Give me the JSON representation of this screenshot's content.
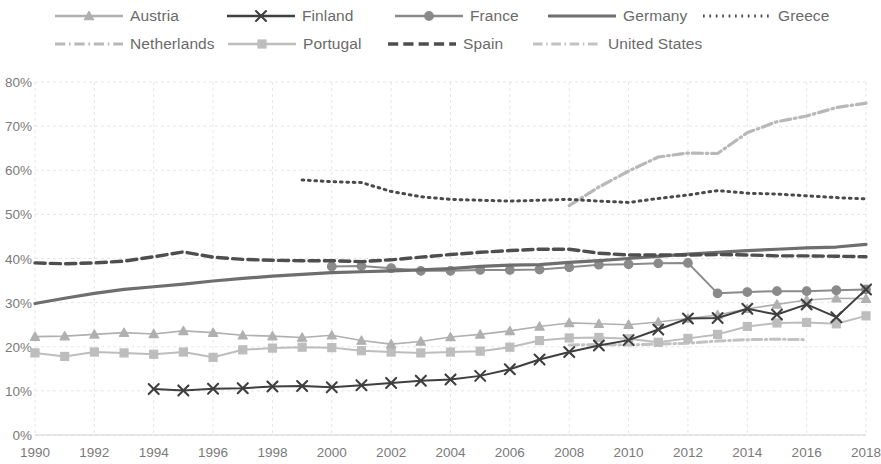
{
  "chart_data": {
    "type": "line",
    "title": "",
    "xlabel": "",
    "ylabel": "",
    "xlim": [
      1990,
      2018
    ],
    "ylim": [
      0,
      80
    ],
    "ytick_labels": [
      "0%",
      "10%",
      "20%",
      "30%",
      "40%",
      "50%",
      "60%",
      "70%",
      "80%"
    ],
    "ytick_values": [
      0,
      10,
      20,
      30,
      40,
      50,
      60,
      70,
      80
    ],
    "xtick_labels": [
      "1990",
      "1992",
      "1994",
      "1996",
      "1998",
      "2000",
      "2002",
      "2004",
      "2006",
      "2008",
      "2010",
      "2012",
      "2014",
      "2016",
      "2018"
    ],
    "xtick_values": [
      1990,
      1992,
      1994,
      1996,
      1998,
      2000,
      2002,
      2004,
      2006,
      2008,
      2010,
      2012,
      2014,
      2016,
      2018
    ],
    "grid": true,
    "legend_position": "top",
    "value_unit": "percent",
    "series": [
      {
        "name": "Austria",
        "color": "#b0b0b0",
        "marker": "triangle",
        "dash": "solid",
        "width": 1.6,
        "x": [
          1990,
          1991,
          1992,
          1993,
          1994,
          1995,
          1996,
          1997,
          1998,
          1999,
          2000,
          2001,
          2002,
          2003,
          2004,
          2005,
          2006,
          2007,
          2008,
          2009,
          2010,
          2011,
          2012,
          2013,
          2014,
          2015,
          2016,
          2017,
          2018
        ],
        "values": [
          22.3,
          22.4,
          22.8,
          23.2,
          22.9,
          23.6,
          23.2,
          22.6,
          22.4,
          22.1,
          22.6,
          21.4,
          20.6,
          21.2,
          22.2,
          22.8,
          23.6,
          24.6,
          25.4,
          25.2,
          25.0,
          25.6,
          26.4,
          27.2,
          28.6,
          29.6,
          30.6,
          31.0,
          30.9
        ]
      },
      {
        "name": "Finland",
        "color": "#3f3f3f",
        "marker": "x",
        "dash": "solid",
        "width": 2.0,
        "x": [
          1994,
          1995,
          1996,
          1997,
          1998,
          1999,
          2000,
          2001,
          2002,
          2003,
          2004,
          2005,
          2006,
          2007,
          2008,
          2009,
          2010,
          2011,
          2012,
          2013,
          2014,
          2015,
          2016,
          2017,
          2018
        ],
        "values": [
          10.4,
          10.1,
          10.5,
          10.6,
          11.0,
          11.1,
          10.8,
          11.3,
          11.8,
          12.3,
          12.6,
          13.4,
          14.9,
          17.1,
          18.8,
          20.3,
          21.5,
          23.9,
          26.4,
          26.5,
          28.6,
          27.3,
          29.6,
          26.7,
          33.0
        ]
      },
      {
        "name": "France",
        "color": "#8a8a8a",
        "marker": "circle",
        "dash": "solid",
        "width": 2.0,
        "x": [
          2000,
          2001,
          2002,
          2003,
          2004,
          2005,
          2006,
          2007,
          2008,
          2009,
          2010,
          2011,
          2012,
          2013,
          2014,
          2015,
          2016,
          2017,
          2018
        ],
        "values": [
          38.2,
          38.3,
          37.8,
          37.2,
          37.2,
          37.4,
          37.4,
          37.5,
          38.0,
          38.6,
          38.7,
          38.9,
          39.0,
          32.1,
          32.4,
          32.6,
          32.6,
          32.8,
          33.0
        ]
      },
      {
        "name": "Germany",
        "color": "#6e6e6e",
        "marker": "none",
        "dash": "solid",
        "width": 3.2,
        "x": [
          1990,
          1991,
          1992,
          1993,
          1994,
          1995,
          1996,
          1997,
          1998,
          1999,
          2000,
          2001,
          2002,
          2003,
          2004,
          2005,
          2006,
          2007,
          2008,
          2009,
          2010,
          2011,
          2012,
          2013,
          2014,
          2015,
          2016,
          2017,
          2018
        ],
        "values": [
          29.8,
          31.0,
          32.1,
          33.0,
          33.6,
          34.2,
          34.9,
          35.5,
          36.0,
          36.4,
          36.8,
          37.0,
          37.2,
          37.4,
          37.7,
          38.2,
          38.5,
          38.6,
          39.1,
          39.5,
          40.0,
          40.5,
          41.0,
          41.4,
          41.8,
          42.1,
          42.4,
          42.6,
          43.2
        ]
      },
      {
        "name": "Greece",
        "color": "#4a4a4a",
        "marker": "none",
        "dash": "dotted",
        "width": 3.0,
        "x": [
          1999,
          2000,
          2001,
          2002,
          2003,
          2004,
          2005,
          2006,
          2007,
          2008,
          2009,
          2010,
          2011,
          2012,
          2013,
          2014,
          2015,
          2016,
          2017,
          2018
        ],
        "values": [
          57.8,
          57.4,
          57.2,
          55.2,
          54.0,
          53.4,
          53.2,
          53.0,
          53.2,
          53.4,
          53.0,
          52.7,
          53.6,
          54.4,
          55.4,
          54.8,
          54.6,
          54.2,
          53.8,
          53.5
        ]
      },
      {
        "name": "Netherlands",
        "color": "#b8b8b8",
        "marker": "none",
        "dash": "dashdot",
        "width": 3.2,
        "x": [
          2008,
          2009,
          2010,
          2011,
          2012,
          2013,
          2014,
          2015,
          2016,
          2017,
          2018
        ],
        "values": [
          52.0,
          56.2,
          59.8,
          63.0,
          63.9,
          63.8,
          68.5,
          71.0,
          72.3,
          74.2,
          75.2
        ]
      },
      {
        "name": "Portugal",
        "color": "#bdbdbd",
        "marker": "square",
        "dash": "solid",
        "width": 2.0,
        "x": [
          1990,
          1991,
          1992,
          1993,
          1994,
          1995,
          1996,
          1997,
          1998,
          1999,
          2000,
          2001,
          2002,
          2003,
          2004,
          2005,
          2006,
          2007,
          2008,
          2009,
          2010,
          2011,
          2012,
          2013,
          2014,
          2015,
          2016,
          2017,
          2018
        ],
        "values": [
          18.6,
          17.8,
          18.8,
          18.6,
          18.3,
          18.8,
          17.6,
          19.3,
          19.7,
          19.9,
          19.8,
          19.1,
          18.8,
          18.6,
          18.8,
          19.0,
          19.9,
          21.4,
          22.0,
          22.1,
          21.8,
          21.0,
          21.9,
          22.8,
          24.6,
          25.4,
          25.5,
          25.2,
          27.0
        ]
      },
      {
        "name": "Spain",
        "color": "#4e4e4e",
        "marker": "none",
        "dash": "dashed",
        "width": 3.4,
        "x": [
          1990,
          1991,
          1992,
          1993,
          1994,
          1995,
          1996,
          1997,
          1998,
          1999,
          2000,
          2001,
          2002,
          2003,
          2004,
          2005,
          2006,
          2007,
          2008,
          2009,
          2010,
          2011,
          2012,
          2013,
          2014,
          2015,
          2016,
          2017,
          2018
        ],
        "values": [
          39.0,
          38.8,
          39.0,
          39.4,
          40.4,
          41.5,
          40.3,
          39.8,
          39.6,
          39.5,
          39.5,
          39.3,
          39.7,
          40.3,
          40.9,
          41.4,
          41.8,
          42.1,
          42.1,
          41.2,
          40.8,
          40.8,
          40.8,
          40.9,
          40.8,
          40.6,
          40.6,
          40.5,
          40.4
        ]
      },
      {
        "name": "United States",
        "color": "#c2c2c2",
        "marker": "none",
        "dash": "dashdot",
        "width": 3.0,
        "x": [
          2008,
          2009,
          2010,
          2011,
          2012,
          2013,
          2014,
          2015,
          2016
        ],
        "values": [
          20.4,
          20.5,
          20.4,
          20.6,
          20.8,
          21.3,
          21.6,
          21.7,
          21.6
        ]
      }
    ]
  },
  "legend": {
    "rows": [
      [
        {
          "label": "Austria",
          "series": 0
        },
        {
          "label": "Finland",
          "series": 1
        },
        {
          "label": "France",
          "series": 2
        },
        {
          "label": "Germany",
          "series": 3
        },
        {
          "label": "Greece",
          "series": 4
        }
      ],
      [
        {
          "label": "Netherlands",
          "series": 5
        },
        {
          "label": "Portugal",
          "series": 6
        },
        {
          "label": "Spain",
          "series": 7
        },
        {
          "label": "United States",
          "series": 8
        }
      ]
    ]
  },
  "colors": {
    "grid": "#e6e6e6",
    "axis_text": "#7a7a7a",
    "legend_text": "#6a6a6a",
    "background": "#ffffff"
  }
}
